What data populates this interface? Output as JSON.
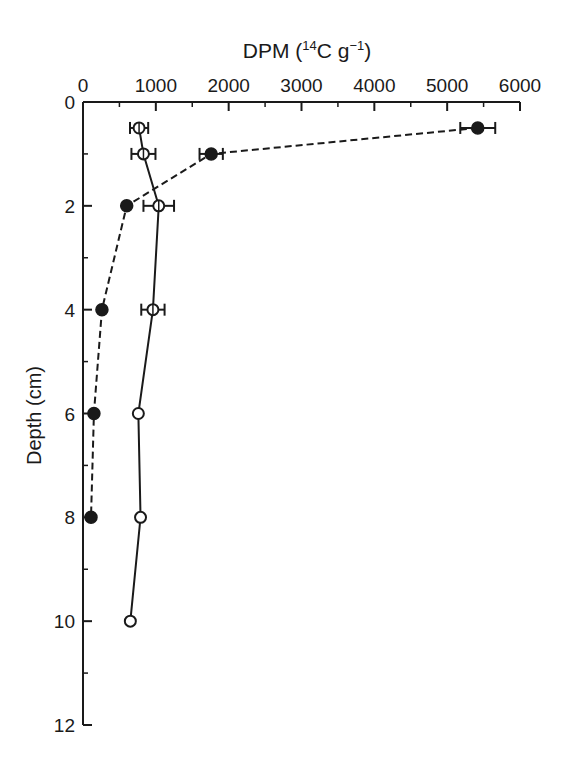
{
  "chart_data": {
    "type": "line",
    "title_parts": {
      "prefix": "DPM (",
      "sup1": "14",
      "mid": "C g",
      "sup2": "−1",
      "suffix": ")"
    },
    "xlabel": "DPM (14C g-1)",
    "ylabel": "Depth (cm)",
    "x_axis_position": "top",
    "y_axis_inverted": true,
    "xlim": [
      0,
      6000
    ],
    "ylim": [
      0,
      12
    ],
    "x_ticks": [
      0,
      1000,
      2000,
      3000,
      4000,
      5000,
      6000
    ],
    "x_minor_ticks": [
      500,
      1500,
      2500,
      3500,
      4500,
      5500
    ],
    "y_ticks": [
      0,
      2,
      4,
      6,
      8,
      10,
      12
    ],
    "y_minor_ticks": [
      1,
      3,
      5,
      7,
      9,
      11
    ],
    "grid": false,
    "legend": null,
    "series": [
      {
        "name": "closed-circles",
        "marker": "filled-circle",
        "line_style": "dashed",
        "points": [
          {
            "depth": 0.5,
            "dpm": 5420,
            "err": 240
          },
          {
            "depth": 1,
            "dpm": 1760,
            "err": 160
          },
          {
            "depth": 2,
            "dpm": 600,
            "err": 0
          },
          {
            "depth": 4,
            "dpm": 260,
            "err": 0
          },
          {
            "depth": 6,
            "dpm": 150,
            "err": 0
          },
          {
            "depth": 8,
            "dpm": 110,
            "err": 0
          }
        ]
      },
      {
        "name": "open-circles",
        "marker": "open-circle",
        "line_style": "solid",
        "points": [
          {
            "depth": 0.5,
            "dpm": 770,
            "err": 125
          },
          {
            "depth": 1,
            "dpm": 830,
            "err": 165
          },
          {
            "depth": 2,
            "dpm": 1040,
            "err": 210
          },
          {
            "depth": 4,
            "dpm": 960,
            "err": 160
          },
          {
            "depth": 6,
            "dpm": 760,
            "err": 0
          },
          {
            "depth": 8,
            "dpm": 790,
            "err": 0
          },
          {
            "depth": 10,
            "dpm": 650,
            "err": 0
          }
        ]
      }
    ]
  }
}
